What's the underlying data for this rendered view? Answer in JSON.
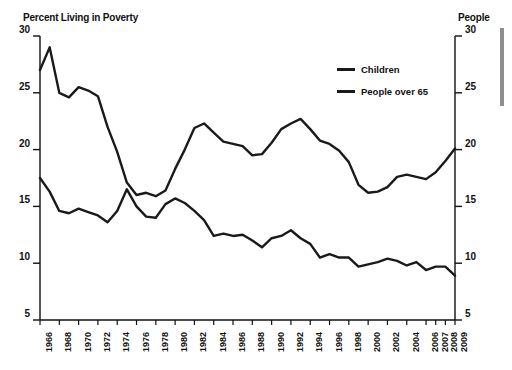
{
  "axis_titles": {
    "left": "Percent Living in Poverty",
    "right": "People"
  },
  "legend": [
    {
      "label": "Children",
      "color": "#1a1a1a"
    },
    {
      "label": "People over 65",
      "color": "#1a1a1a"
    }
  ],
  "chart_data": {
    "type": "line",
    "title": "Percent Living in Poverty",
    "xlabel": "",
    "ylabel": "Percent Living in Poverty",
    "ylabel_right": "People",
    "ylim": [
      5,
      30
    ],
    "yticks": [
      5,
      10,
      15,
      20,
      25,
      30
    ],
    "grid": false,
    "legend_position": "top-right",
    "xtick_labels": [
      "1966",
      "1968",
      "1970",
      "1972",
      "1974",
      "1976",
      "1978",
      "1980",
      "1982",
      "1984",
      "1986",
      "1988",
      "1990",
      "1992",
      "1994",
      "1996",
      "1998",
      "2000",
      "2002",
      "2004",
      "2006",
      "2007",
      "2008",
      "2009"
    ],
    "x": [
      1966,
      1967,
      1968,
      1969,
      1970,
      1971,
      1972,
      1973,
      1974,
      1975,
      1976,
      1977,
      1978,
      1979,
      1980,
      1981,
      1982,
      1983,
      1984,
      1985,
      1986,
      1987,
      1988,
      1989,
      1990,
      1991,
      1992,
      1993,
      1994,
      1995,
      1996,
      1997,
      1998,
      1999,
      2000,
      2001,
      2002,
      2003,
      2004,
      2005,
      2006,
      2007,
      2008,
      2009
    ],
    "series": [
      {
        "name": "Children",
        "color": "#1a1a1a",
        "values": [
          27.0,
          29.0,
          25.0,
          24.6,
          25.5,
          25.2,
          24.7,
          22.0,
          19.8,
          17.1,
          16.0,
          16.2,
          15.9,
          16.4,
          18.3,
          20.0,
          21.9,
          22.3,
          21.5,
          20.7,
          20.5,
          20.3,
          19.5,
          19.6,
          20.6,
          21.8,
          22.3,
          22.7,
          21.8,
          20.8,
          20.5,
          19.9,
          18.9,
          16.9,
          16.2,
          16.3,
          16.7,
          17.6,
          17.8,
          17.6,
          17.4,
          18.0,
          19.0,
          20.1
        ]
      },
      {
        "name": "People over 65",
        "color": "#1a1a1a",
        "values": [
          17.5,
          16.3,
          14.6,
          14.4,
          14.8,
          14.5,
          14.2,
          13.6,
          14.6,
          16.5,
          15.0,
          14.1,
          14.0,
          15.2,
          15.7,
          15.3,
          14.6,
          13.8,
          12.4,
          12.6,
          12.4,
          12.5,
          12.0,
          11.4,
          12.2,
          12.4,
          12.9,
          12.2,
          11.7,
          10.5,
          10.8,
          10.5,
          10.5,
          9.7,
          9.9,
          10.1,
          10.4,
          10.2,
          9.8,
          10.1,
          9.4,
          9.7,
          9.7,
          8.9
        ]
      }
    ]
  },
  "plot_geometry": {
    "left": 40,
    "right": 455,
    "top": 36,
    "bottom": 320
  }
}
